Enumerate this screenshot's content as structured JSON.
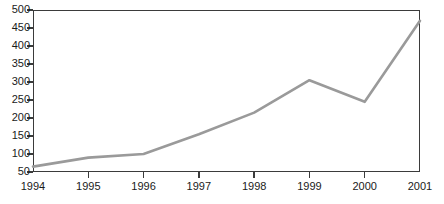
{
  "chart_data": {
    "type": "line",
    "title": "",
    "xlabel": "",
    "ylabel": "",
    "categories": [
      "1994",
      "1995",
      "1996",
      "1997",
      "1998",
      "1999",
      "2000",
      "2001"
    ],
    "x": [
      1994,
      1995,
      1996,
      1997,
      1998,
      1999,
      2000,
      2001
    ],
    "values": [
      65,
      90,
      100,
      155,
      215,
      305,
      245,
      470
    ],
    "series": [
      {
        "name": "",
        "values": [
          65,
          90,
          100,
          155,
          215,
          305,
          245,
          470
        ],
        "color": "#9a9a9a"
      }
    ],
    "ylim": [
      50,
      500
    ],
    "xlim": [
      1994,
      2001
    ],
    "y_ticks": [
      50,
      100,
      150,
      200,
      250,
      300,
      350,
      400,
      450,
      500
    ],
    "y_tick_labels": [
      "50",
      "100",
      "150",
      "200",
      "250",
      "300",
      "350",
      "400",
      "450",
      "500"
    ],
    "x_ticks": [
      1994,
      1995,
      1996,
      1997,
      1998,
      1999,
      2000,
      2001
    ],
    "x_tick_labels": [
      "1994",
      "1995",
      "1996",
      "1997",
      "1998",
      "1999",
      "2000",
      "2001"
    ],
    "grid": false,
    "legend": false,
    "legend_position": "none",
    "line_color": "#9a9a9a",
    "axis_color": "#3b3b3b",
    "background_color": "#ffffff",
    "text_color": "#1a1a1a"
  }
}
